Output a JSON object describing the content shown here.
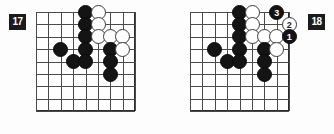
{
  "page": {
    "background": "#fdfdfd",
    "width": 334,
    "height": 134,
    "kind": "go-problem-diagram-pair"
  },
  "colors": {
    "black_stone": "#141414",
    "white_stone": "#ffffff",
    "stone_outline": "#3a3a3a",
    "grid_line": "#4a4a4a",
    "board_border": "#2b2b2b",
    "badge_bg": "#1b1b1b",
    "badge_text": "#ffffff"
  },
  "diagrams": [
    {
      "id": "diagram-17",
      "badge_label": "17",
      "badge_side": "left",
      "board": {
        "cols": 9,
        "rows": 9,
        "left": 36,
        "top": 12,
        "cell": 12.4
      },
      "stones": [
        {
          "color": "black",
          "col": 5,
          "row": 1
        },
        {
          "color": "white",
          "col": 6,
          "row": 1
        },
        {
          "color": "black",
          "col": 5,
          "row": 2
        },
        {
          "color": "white",
          "col": 6,
          "row": 2
        },
        {
          "color": "black",
          "col": 5,
          "row": 3
        },
        {
          "color": "white",
          "col": 6,
          "row": 3
        },
        {
          "color": "white",
          "col": 7,
          "row": 3
        },
        {
          "color": "white",
          "col": 8,
          "row": 3
        },
        {
          "color": "black",
          "col": 3,
          "row": 4
        },
        {
          "color": "black",
          "col": 5,
          "row": 4
        },
        {
          "color": "black",
          "col": 7,
          "row": 4
        },
        {
          "color": "white",
          "col": 8,
          "row": 4
        },
        {
          "color": "black",
          "col": 4,
          "row": 5
        },
        {
          "color": "black",
          "col": 5,
          "row": 5
        },
        {
          "color": "black",
          "col": 7,
          "row": 5
        },
        {
          "color": "black",
          "col": 7,
          "row": 6
        }
      ]
    },
    {
      "id": "diagram-18",
      "badge_label": "18",
      "badge_side": "right",
      "board": {
        "cols": 9,
        "rows": 9,
        "left": 190,
        "top": 12,
        "cell": 12.4
      },
      "stones": [
        {
          "color": "black",
          "col": 5,
          "row": 1
        },
        {
          "color": "white",
          "col": 6,
          "row": 1
        },
        {
          "color": "black",
          "col": 8,
          "row": 1,
          "move": "3"
        },
        {
          "color": "black",
          "col": 5,
          "row": 2
        },
        {
          "color": "white",
          "col": 6,
          "row": 2
        },
        {
          "color": "white",
          "col": 9,
          "row": 2,
          "move": "2"
        },
        {
          "color": "black",
          "col": 5,
          "row": 3
        },
        {
          "color": "white",
          "col": 6,
          "row": 3
        },
        {
          "color": "white",
          "col": 7,
          "row": 3
        },
        {
          "color": "white",
          "col": 8,
          "row": 3
        },
        {
          "color": "black",
          "col": 9,
          "row": 3,
          "move": "1"
        },
        {
          "color": "black",
          "col": 3,
          "row": 4
        },
        {
          "color": "black",
          "col": 5,
          "row": 4
        },
        {
          "color": "black",
          "col": 7,
          "row": 4
        },
        {
          "color": "white",
          "col": 8,
          "row": 4
        },
        {
          "color": "black",
          "col": 4,
          "row": 5
        },
        {
          "color": "black",
          "col": 5,
          "row": 5
        },
        {
          "color": "black",
          "col": 7,
          "row": 5
        },
        {
          "color": "black",
          "col": 7,
          "row": 6
        }
      ]
    }
  ]
}
